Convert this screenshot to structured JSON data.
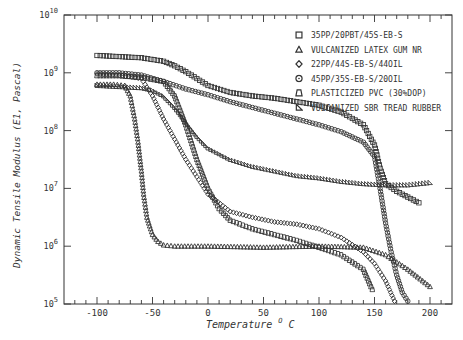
{
  "chart_data": {
    "type": "scatter",
    "title": "",
    "xlabel": "Temperature °C",
    "ylabel": "Dynamic Tensile Modulus (E1, Pascal)",
    "xlim": [
      -130,
      220
    ],
    "ylim_log10": [
      5,
      10
    ],
    "yscale": "log",
    "x_ticks": [
      -100,
      -50,
      0,
      50,
      100,
      150,
      200
    ],
    "y_ticks": [
      "10^5",
      "10^6",
      "10^7",
      "10^8",
      "10^9",
      "10^10"
    ],
    "grid": false,
    "legend_position": "upper right",
    "series": [
      {
        "name": "35PP/20PBT/45S-EB-S",
        "marker": "square",
        "x": [
          -100,
          -80,
          -60,
          -40,
          -30,
          -20,
          -10,
          0,
          20,
          40,
          60,
          80,
          100,
          120,
          140,
          150,
          155,
          160,
          170,
          180,
          190
        ],
        "log10_y": [
          9.3,
          9.28,
          9.26,
          9.2,
          9.12,
          9.02,
          8.9,
          8.78,
          8.66,
          8.6,
          8.56,
          8.5,
          8.44,
          8.32,
          8.1,
          7.75,
          7.35,
          7.08,
          6.95,
          6.85,
          6.75
        ]
      },
      {
        "name": "VULCANIZED LATEX GUM NR",
        "marker": "triangle",
        "x": [
          -100,
          -85,
          -75,
          -70,
          -66,
          -63,
          -60,
          -58,
          -55,
          -50,
          -45,
          -40,
          -30,
          0,
          50,
          100,
          140,
          160,
          180,
          200
        ],
        "log10_y": [
          8.8,
          8.8,
          8.78,
          8.6,
          8.2,
          7.8,
          7.3,
          6.9,
          6.5,
          6.2,
          6.08,
          6.02,
          6.0,
          6.0,
          5.98,
          6.0,
          5.98,
          5.85,
          5.6,
          5.3
        ]
      },
      {
        "name": "22PP/44S-EB-S/44OIL",
        "marker": "diamond",
        "x": [
          -100,
          -80,
          -60,
          -50,
          -40,
          -30,
          -20,
          -10,
          0,
          20,
          40,
          60,
          80,
          100,
          120,
          140,
          150,
          160,
          168
        ],
        "log10_y": [
          8.98,
          8.96,
          8.9,
          8.6,
          8.2,
          7.85,
          7.5,
          7.2,
          6.9,
          6.6,
          6.5,
          6.42,
          6.38,
          6.3,
          6.15,
          5.9,
          5.7,
          5.4,
          5.05
        ]
      },
      {
        "name": "45PP/35S-EB-S/20OIL",
        "marker": "circle",
        "x": [
          -100,
          -80,
          -60,
          -40,
          -20,
          0,
          20,
          40,
          60,
          80,
          100,
          120,
          140,
          150,
          155,
          160,
          165,
          170,
          175,
          180
        ],
        "log10_y": [
          9.0,
          9.0,
          8.96,
          8.85,
          8.72,
          8.62,
          8.5,
          8.4,
          8.3,
          8.2,
          8.1,
          7.98,
          7.8,
          7.55,
          7.0,
          6.4,
          5.9,
          5.5,
          5.2,
          5.05
        ]
      },
      {
        "name": "PLASTICIZED PVC (30%DOP)",
        "marker": "bell",
        "x": [
          -100,
          -80,
          -60,
          -40,
          -30,
          -20,
          -10,
          0,
          10,
          20,
          40,
          60,
          80,
          100,
          120,
          140,
          148
        ],
        "log10_y": [
          8.95,
          8.95,
          8.92,
          8.85,
          8.6,
          8.1,
          7.5,
          7.0,
          6.65,
          6.45,
          6.3,
          6.2,
          6.1,
          5.98,
          5.85,
          5.6,
          5.25
        ]
      },
      {
        "name": "VULCANIZED SBR TREAD RUBBER",
        "marker": "right-triangle",
        "x": [
          -100,
          -80,
          -60,
          -50,
          -40,
          -30,
          -20,
          -10,
          0,
          20,
          40,
          60,
          80,
          100,
          120,
          140,
          160,
          180,
          200
        ],
        "log10_y": [
          8.78,
          8.76,
          8.74,
          8.7,
          8.6,
          8.4,
          8.15,
          7.9,
          7.7,
          7.5,
          7.38,
          7.3,
          7.22,
          7.18,
          7.12,
          7.08,
          7.06,
          7.06,
          7.1
        ]
      }
    ]
  },
  "axes": {
    "xlabel_main": "Temperature",
    "xlabel_unit_sup": "O",
    "xlabel_unit": "C",
    "ylabel": "Dynamic Tensile Modulus (E1, Pascal)",
    "x_tick_labels": [
      "-100",
      "-50",
      "0",
      "50",
      "100",
      "150",
      "200"
    ],
    "y_tick_base": "10",
    "y_tick_exponents": [
      "10",
      "9",
      "8",
      "7",
      "6",
      "5"
    ]
  },
  "legend": {
    "items": [
      "35PP/20PBT/45S-EB-S",
      "VULCANIZED LATEX GUM NR",
      "22PP/44S-EB-S/44OIL",
      "45PP/35S-EB-S/20OIL",
      "PLASTICIZED PVC (30%DOP)",
      "VULCANIZED SBR TREAD RUBBER"
    ]
  },
  "colors": {
    "ink": "#333333",
    "background": "#ffffff"
  }
}
